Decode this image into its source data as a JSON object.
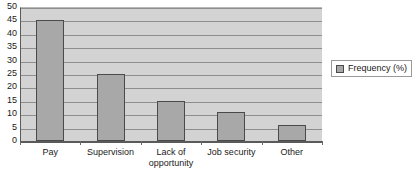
{
  "chart_data": {
    "type": "bar",
    "title": "",
    "xlabel": "",
    "ylabel": "",
    "categories": [
      "Pay",
      "Supervision",
      "Lack of\nopportunity",
      "Job security",
      "Other"
    ],
    "values": [
      45,
      25,
      15,
      11,
      6
    ],
    "series": [
      {
        "name": "Frequency (%)",
        "values": [
          45,
          25,
          15,
          11,
          6
        ]
      }
    ],
    "ylim": [
      0,
      50
    ],
    "ytick_step": 5,
    "yticks": [
      50,
      45,
      40,
      35,
      30,
      25,
      20,
      15,
      10,
      5,
      0
    ],
    "grid": true,
    "legend_position": "right",
    "legend_entries": [
      "Frequency (%)"
    ],
    "colors": {
      "bar_fill": "#a8a8a8",
      "bar_border": "#4a4a4a",
      "plot_background": "#d3d3d3",
      "gridline": "#8e8e8e",
      "axis": "#5a5a5a",
      "text": "#1a1a1a",
      "chart_background": "#ffffff"
    }
  },
  "legend": {
    "label": "Frequency (%)",
    "swatch_name": "frequency-swatch"
  }
}
